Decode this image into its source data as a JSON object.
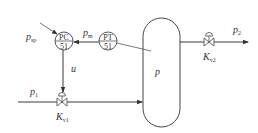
{
  "diagram": {
    "controller": {
      "tag": "PC",
      "loop": "51"
    },
    "transmitter": {
      "tag": "PT",
      "loop": "51"
    },
    "vessel": {
      "label": "p"
    },
    "signals": {
      "setpoint": {
        "main": "p",
        "sub": "sp"
      },
      "measurement": {
        "main": "p",
        "sub": "m"
      },
      "output": "u"
    },
    "streams": {
      "inlet": {
        "main": "p",
        "sub": "1"
      },
      "outlet": {
        "main": "p",
        "sub": "2"
      }
    },
    "valves": {
      "inlet": {
        "main": "K",
        "sub": "v1"
      },
      "outlet": {
        "main": "K",
        "sub": "v2"
      }
    },
    "colors": {
      "stroke": "#3a3a3a",
      "background": "#ffffff"
    }
  }
}
